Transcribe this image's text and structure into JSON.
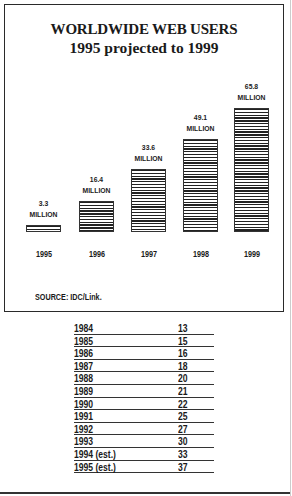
{
  "chart_data": {
    "type": "bar",
    "title": "WORLDWIDE WEB USERS",
    "subtitle": "1995 projected to 1999",
    "categories": [
      "1995",
      "1996",
      "1997",
      "1998",
      "1999"
    ],
    "values": [
      3.3,
      16.4,
      33.6,
      49.1,
      65.8
    ],
    "value_labels": [
      "3.3",
      "16.4",
      "33.6",
      "49.1",
      "65.8"
    ],
    "unit_label": "MILLION",
    "xlabel": "",
    "ylabel": "",
    "ylim": [
      0,
      70
    ],
    "grid": false,
    "legend": null,
    "source": "SOURCE: IDC/Link.",
    "pattern": "horizontal-stripes",
    "colors": {
      "bar": "#222222",
      "frame": "#2a2a2a"
    }
  },
  "table": {
    "rows": [
      {
        "year": "1984",
        "value": "13"
      },
      {
        "year": "1985",
        "value": "15"
      },
      {
        "year": "1986",
        "value": "16"
      },
      {
        "year": "1987",
        "value": "18"
      },
      {
        "year": "1988",
        "value": "20"
      },
      {
        "year": "1989",
        "value": "21"
      },
      {
        "year": "1990",
        "value": "22"
      },
      {
        "year": "1991",
        "value": "25"
      },
      {
        "year": "1992",
        "value": "27"
      },
      {
        "year": "1993",
        "value": "30"
      },
      {
        "year": "1994 (est.)",
        "value": "33"
      },
      {
        "year": "1995 (est.)",
        "value": "37"
      }
    ]
  }
}
